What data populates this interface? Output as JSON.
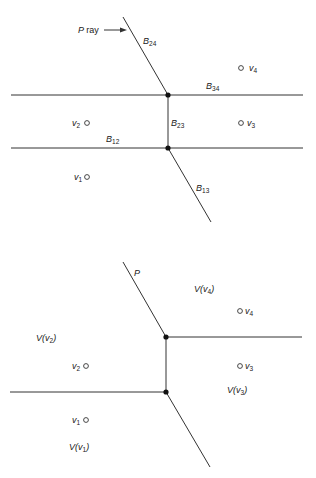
{
  "top_diagram": {
    "labels": {
      "p_ray": "P",
      "p_ray_word": "ray",
      "b24_main": "B",
      "b24_sub": "24",
      "b34_main": "B",
      "b34_sub": "34",
      "b23_main": "B",
      "b23_sub": "23",
      "b12_main": "B",
      "b12_sub": "12",
      "b13_main": "B",
      "b13_sub": "13",
      "v1_main": "v",
      "v1_sub": "1",
      "v2_main": "v",
      "v2_sub": "2",
      "v3_main": "v",
      "v3_sub": "3",
      "v4_main": "v",
      "v4_sub": "4"
    }
  },
  "bottom_diagram": {
    "labels": {
      "p": "P",
      "vv4_a": "V(v",
      "vv4_sub": "4",
      "vv4_b": ")",
      "vv2_a": "V(v",
      "vv2_sub": "2",
      "vv2_b": ")",
      "vv3_a": "V(v",
      "vv3_sub": "3",
      "vv3_b": ")",
      "vv1_a": "V(v",
      "vv1_sub": "1",
      "vv1_b": ")",
      "v1_main": "v",
      "v1_sub": "1",
      "v2_main": "v",
      "v2_sub": "2",
      "v3_main": "v",
      "v3_sub": "3",
      "v4_main": "v",
      "v4_sub": "4"
    }
  },
  "colors": {
    "line": "#333333",
    "text": "#222222",
    "background": "#ffffff"
  }
}
